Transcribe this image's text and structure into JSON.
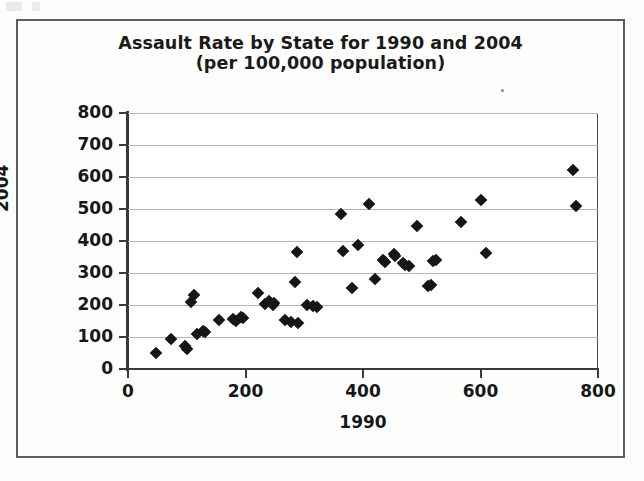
{
  "figure": {
    "title_line1": "Assault Rate by State for 1990 and 2004",
    "title_line2": "(per 100,000 population)",
    "xlabel": "1990",
    "ylabel": "2004"
  },
  "axes": {
    "y_ticks": [
      "800",
      "700",
      "600",
      "500",
      "400",
      "300",
      "200",
      "100",
      "0"
    ],
    "x_ticks": [
      "0",
      "200",
      "400",
      "600",
      "800"
    ]
  },
  "colors": {
    "marker": "#15151a",
    "gridline": "#b4b4b4",
    "axis": "#3a3a3a",
    "frame": "#5d5d5d",
    "background": "#ffffff",
    "text": "#171717"
  },
  "chart_data": {
    "type": "scatter",
    "title": "Assault Rate by State for 1990 and 2004 (per 100,000 population)",
    "xlabel": "1990",
    "ylabel": "2004",
    "xlim": [
      0,
      800
    ],
    "ylim": [
      0,
      800
    ],
    "xticks": [
      0,
      200,
      400,
      600,
      800
    ],
    "yticks": [
      0,
      100,
      200,
      300,
      400,
      500,
      600,
      700,
      800
    ],
    "grid": "horizontal",
    "legend": null,
    "marker": "diamond",
    "n_points": 48,
    "points": [
      [
        47,
        50
      ],
      [
        73,
        95
      ],
      [
        97,
        72
      ],
      [
        100,
        63
      ],
      [
        108,
        210
      ],
      [
        112,
        232
      ],
      [
        118,
        110
      ],
      [
        127,
        118
      ],
      [
        131,
        116
      ],
      [
        155,
        152
      ],
      [
        178,
        155
      ],
      [
        183,
        150
      ],
      [
        193,
        163
      ],
      [
        196,
        158
      ],
      [
        222,
        237
      ],
      [
        233,
        202
      ],
      [
        240,
        212
      ],
      [
        246,
        200
      ],
      [
        249,
        205
      ],
      [
        268,
        152
      ],
      [
        277,
        148
      ],
      [
        284,
        272
      ],
      [
        287,
        365
      ],
      [
        289,
        145
      ],
      [
        305,
        200
      ],
      [
        315,
        197
      ],
      [
        322,
        193
      ],
      [
        362,
        485
      ],
      [
        366,
        370
      ],
      [
        381,
        252
      ],
      [
        392,
        388
      ],
      [
        410,
        515
      ],
      [
        421,
        280
      ],
      [
        434,
        342
      ],
      [
        438,
        335
      ],
      [
        452,
        358
      ],
      [
        455,
        352
      ],
      [
        468,
        330
      ],
      [
        472,
        325
      ],
      [
        478,
        322
      ],
      [
        492,
        447
      ],
      [
        511,
        258
      ],
      [
        515,
        263
      ],
      [
        519,
        338
      ],
      [
        525,
        340
      ],
      [
        566,
        460
      ],
      [
        601,
        527
      ],
      [
        609,
        362
      ],
      [
        757,
        623
      ],
      [
        762,
        510
      ]
    ]
  }
}
